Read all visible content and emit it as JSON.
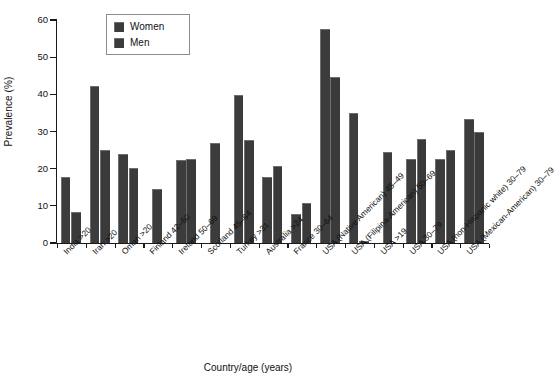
{
  "chart_data": {
    "type": "bar",
    "title": "",
    "xlabel": "Country/age (years)",
    "ylabel": "Prevalence (%)",
    "ylim": [
      0,
      60
    ],
    "ytick_values": [
      0,
      10,
      20,
      30,
      40,
      50,
      60
    ],
    "ytick_labels": [
      "0",
      "10",
      "20",
      "30",
      "40",
      "50",
      "60"
    ],
    "grid": false,
    "legend_position": "upper-left-inside",
    "categories": [
      "India >20",
      "Iran >20",
      "Oman >20",
      "Finland 42–60",
      "Ireland 50–69",
      "Scotland 45–64",
      "Turkey >31",
      "Australia >24",
      "France 30–64",
      "USA (Native American) 45–49",
      "USA (Filipina-American) 50–69",
      "USA >19",
      "USA 30–79",
      "USA (non-Hispanic white) 30–79",
      "USA (Mexican-American) 30–79"
    ],
    "series": [
      {
        "name": "Women",
        "color": "#3c3c3c",
        "values": [
          17.8,
          42.3,
          24.0,
          14.6,
          22.3,
          26.9,
          39.7,
          17.7,
          7.8,
          57.6,
          35.0,
          24.6,
          22.5,
          22.6,
          33.4
        ]
      },
      {
        "name": "Men",
        "color": "#3a3a3a",
        "values": [
          8.4,
          25.1,
          20.2,
          null,
          22.6,
          null,
          27.6,
          20.6,
          10.8,
          44.6,
          0.5,
          null,
          28.1,
          25.0,
          29.8
        ]
      }
    ]
  },
  "legend": {
    "items": [
      {
        "label": "Women"
      },
      {
        "label": "Men"
      }
    ]
  }
}
